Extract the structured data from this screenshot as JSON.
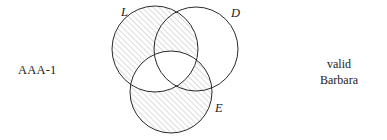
{
  "left_label": {
    "text": "AAA-1"
  },
  "verdict": {
    "line1": "valid",
    "line2": "Barbara"
  },
  "diagram": {
    "type": "venn-3-circle",
    "circles": [
      {
        "id": "L",
        "label": "L",
        "cx": 55,
        "cy": 49,
        "r": 43,
        "label_x": 21,
        "label_y": 16
      },
      {
        "id": "D",
        "label": "D",
        "cx": 96,
        "cy": 49,
        "r": 42,
        "label_x": 131,
        "label_y": 17
      },
      {
        "id": "E",
        "label": "E",
        "cx": 71,
        "cy": 92,
        "r": 41,
        "label_x": 115,
        "label_y": 112
      }
    ],
    "shaded_regions": [
      {
        "id": "L-minus-E",
        "description": "region L excluding E is hatched"
      },
      {
        "id": "E-minus-L",
        "description": "region E excluding L is hatched"
      }
    ],
    "unshaded_regions": [
      {
        "id": "D-only",
        "description": "region D excluding L and E is blank"
      },
      {
        "id": "L-and-E",
        "description": "intersection of L and E is blank"
      }
    ],
    "hatch": {
      "angle_deg": 45,
      "color": "#9a9a9a",
      "spacing_px": 4,
      "stroke_width": 0.7
    },
    "stroke_color": "#2b2b2b",
    "stroke_width": 1.0
  }
}
